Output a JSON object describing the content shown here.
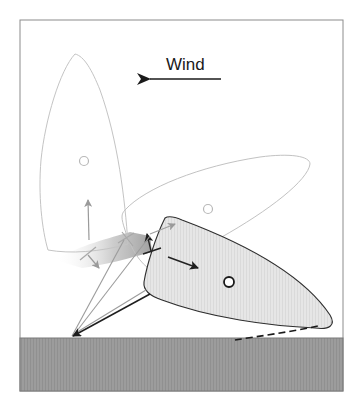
{
  "diagram": {
    "wind_label": "Wind",
    "frame": {
      "x": 20,
      "y": 20,
      "width": 323,
      "height": 371,
      "stroke": "#888888"
    },
    "ground": {
      "x": 20,
      "y": 338,
      "width": 323,
      "height": 53,
      "fill": "#9a9a9a"
    },
    "colors": {
      "outline_light": "#bdbdbd",
      "outline_dark": "#333333",
      "hull_fill": "#e4e4e4",
      "arrow_gray": "#999999",
      "arrow_dark": "#222222"
    },
    "boats": [
      {
        "name": "boat-upright",
        "state": "ghost",
        "center": [
          83,
          160
        ]
      },
      {
        "name": "boat-rotating",
        "state": "ghost",
        "center": [
          208,
          210
        ]
      },
      {
        "name": "boat-final",
        "state": "solid",
        "center": [
          229,
          282
        ]
      }
    ]
  }
}
